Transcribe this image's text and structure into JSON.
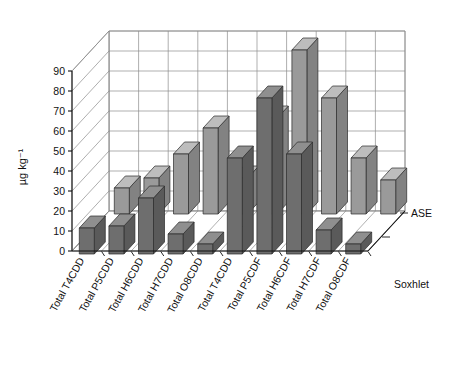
{
  "chart_data": {
    "type": "bar",
    "subtype": "3d-grouped-bar",
    "title": "",
    "xlabel": "",
    "ylabel": "µg kg⁻¹",
    "ylim": [
      0,
      90
    ],
    "ytick_step": 10,
    "yticks": [
      0,
      10,
      20,
      30,
      40,
      50,
      60,
      70,
      80,
      90
    ],
    "ytick_labels": [
      "0",
      "10",
      "20",
      "30",
      "40",
      "50",
      "60",
      "70",
      "80",
      "90"
    ],
    "grid": true,
    "legend_position": "right",
    "categories": [
      "Total T4CDD",
      "Total P5CDD",
      "Total H6CDD",
      "Total H7CDD",
      "Total O8CDD",
      "Total T4CDD",
      "Total P5CDF",
      "Total H6CDF",
      "Total H7CDF",
      "Total O8CDF"
    ],
    "series": [
      {
        "name": "ASE",
        "row": "back",
        "color": "#9a9a9a",
        "values": [
          13,
          18,
          30,
          43,
          18,
          48,
          82,
          58,
          28,
          17
        ]
      },
      {
        "name": "Soxhlet",
        "row": "front",
        "color": "#6e6e6e",
        "values": [
          13,
          14,
          28,
          10,
          5,
          48,
          78,
          50,
          12,
          5
        ]
      }
    ]
  },
  "legend": {
    "entries": [
      {
        "label": "ASE"
      },
      {
        "label": "Soxhlet"
      }
    ]
  },
  "axis": {
    "y_title": "µg kg⁻¹"
  },
  "colors": {
    "back_front_face": "#9a9a9a",
    "back_top_face": "#bdbdbd",
    "back_side_face": "#828282",
    "front_front_face": "#6e6e6e",
    "front_top_face": "#8f8f8f",
    "front_side_face": "#5a5a5a",
    "grid": "#8c8c8c",
    "axis": "#111111",
    "background": "#ffffff"
  }
}
